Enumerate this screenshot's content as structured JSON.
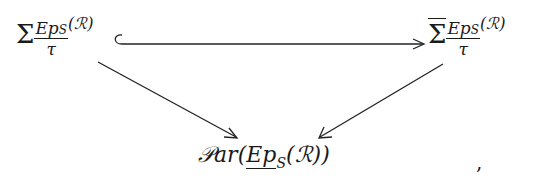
{
  "diagram": {
    "type": "commutative-diagram",
    "nodes": {
      "top_left": {
        "symbol": "Σ",
        "numerator": "Ep",
        "numerator_sub": "S",
        "denominator": "τ",
        "argument": "(ℛ)"
      },
      "top_right": {
        "symbol": "Σ",
        "overline": true,
        "numerator": "Ep",
        "numerator_sub": "S",
        "denominator": "τ",
        "argument": "(ℛ)"
      },
      "bottom": {
        "prefix": "𝒫ar(",
        "underlined": "Ep",
        "sub": "S",
        "argument": "(ℛ))"
      }
    },
    "edges": [
      {
        "from": "top_left",
        "to": "top_right",
        "style": "hook-arrow"
      },
      {
        "from": "top_left",
        "to": "bottom",
        "style": "arrow"
      },
      {
        "from": "top_right",
        "to": "bottom",
        "style": "arrow"
      }
    ],
    "trailing_punctuation": ","
  }
}
